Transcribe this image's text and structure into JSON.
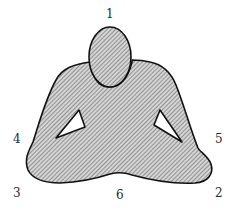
{
  "figure": {
    "fill": "#b8b8b8",
    "stroke": "#111111",
    "hatch_color": "#7a7a7a",
    "labels": [
      {
        "id": "1",
        "text": "1",
        "x": 106,
        "y": 8
      },
      {
        "id": "2",
        "text": "2",
        "x": 215,
        "y": 187
      },
      {
        "id": "3",
        "text": "3",
        "x": 13,
        "y": 187
      },
      {
        "id": "4",
        "text": "4",
        "x": 13,
        "y": 133
      },
      {
        "id": "5",
        "text": "5",
        "x": 215,
        "y": 133
      },
      {
        "id": "6",
        "text": "6",
        "x": 116,
        "y": 189
      }
    ]
  }
}
